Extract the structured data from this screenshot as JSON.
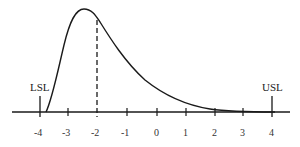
{
  "diagram": {
    "type": "skewed distribution with specification limits",
    "lower_spec_label": "LSL",
    "upper_spec_label": "USL",
    "lower_spec_value": -4,
    "upper_spec_value": 4,
    "mode_marker_value": -2,
    "axis_ticks": [
      "-4",
      "-3",
      "-2",
      "-1",
      "0",
      "1",
      "2",
      "3",
      "4"
    ],
    "colors": {
      "line": "#1a1a1a",
      "background": "#ffffff"
    }
  }
}
